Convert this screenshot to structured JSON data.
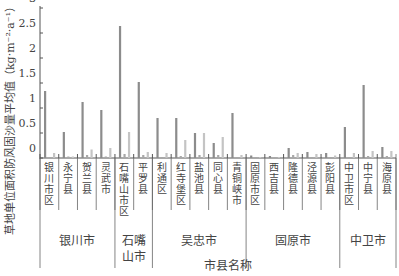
{
  "chart_data": {
    "type": "bar",
    "title": "",
    "ylabel": "草地单位面积防风固沙量平均值（kg·m⁻²·a⁻¹）",
    "xlabel": "市县名称",
    "ylim": [
      0,
      3
    ],
    "yticks": [
      "0",
      "0.5",
      "1",
      "1.5",
      "2",
      "2.5",
      "3"
    ],
    "grid": false,
    "legend": null,
    "categories": [
      "银川市区",
      "永宁县",
      "贺兰县",
      "灵武市",
      "石嘴山市区",
      "平罗县",
      "利通区",
      "红寺堡区",
      "盐池县",
      "同心县",
      "青铜峡市",
      "固原市区",
      "西吉县",
      "隆德县",
      "泾源县",
      "彭阳县",
      "中卫市区",
      "中宁县",
      "海原县"
    ],
    "groups": [
      {
        "name": "银川市",
        "members": [
          "银川市区",
          "永宁县",
          "贺兰县",
          "灵武市"
        ]
      },
      {
        "name": "石嘴山市",
        "members": [
          "石嘴山市区",
          "平罗县"
        ]
      },
      {
        "name": "吴忠市",
        "members": [
          "利通区",
          "红寺堡区",
          "盐池县",
          "同心县",
          "青铜峡市"
        ]
      },
      {
        "name": "固原市",
        "members": [
          "固原市区",
          "西吉县",
          "隆德县",
          "泾源县",
          "彭阳县"
        ]
      },
      {
        "name": "中卫市",
        "members": [
          "中卫市区",
          "中宁县",
          "海原县"
        ]
      }
    ],
    "series": [
      {
        "name": "series-1",
        "color": "#8c8c8c",
        "values": [
          1.34,
          0.52,
          1.12,
          0.96,
          2.64,
          1.52,
          0.8,
          0.8,
          0.5,
          0.3,
          0.9,
          0.05,
          0.04,
          0.2,
          0.12,
          0.1,
          0.62,
          1.46,
          0.22
        ]
      },
      {
        "name": "series-2",
        "color": "#a8a8a8",
        "values": [
          0.02,
          0.03,
          0.06,
          0.03,
          0.08,
          0.06,
          0.02,
          0.04,
          0.06,
          0.06,
          0.02,
          0.02,
          0.02,
          0.06,
          0.02,
          0.02,
          0.02,
          0.04,
          0.04
        ]
      },
      {
        "name": "series-3",
        "color": "#c4c4c4",
        "values": [
          0.1,
          0.03,
          0.17,
          0.2,
          0.52,
          0.12,
          0.1,
          0.36,
          0.5,
          0.42,
          0.06,
          0.02,
          0.02,
          0.1,
          0.08,
          0.05,
          0.1,
          0.14,
          0.14
        ]
      }
    ]
  }
}
